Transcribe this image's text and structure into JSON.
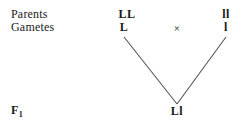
{
  "diagram": {
    "background_color": "#ffffff",
    "text_color": "#1a1a1a",
    "line_color": "#555555",
    "rows": {
      "parents": {
        "label": "Parents",
        "left_genotype": "LL",
        "right_genotype": "ll"
      },
      "gametes": {
        "label": "Gametes",
        "left_gamete": "L",
        "right_gamete": "l",
        "cross_symbol": "×"
      },
      "f1": {
        "label_base": "F",
        "label_subscript": "1",
        "genotype": "Ll"
      }
    },
    "connectors": [
      {
        "name": "left-gamete-to-f1",
        "x1": 124,
        "y1": 37,
        "x2": 177,
        "y2": 104
      },
      {
        "name": "right-gamete-to-f1",
        "x1": 226,
        "y1": 37,
        "x2": 177,
        "y2": 104
      }
    ]
  }
}
